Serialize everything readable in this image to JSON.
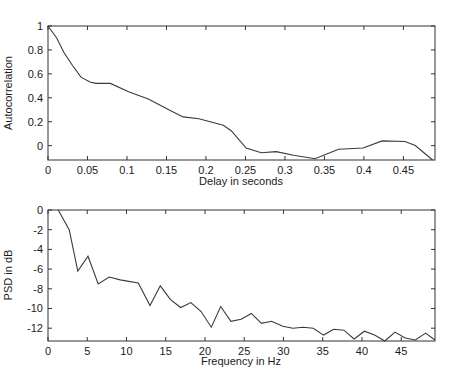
{
  "chart_data": [
    {
      "type": "line",
      "title": "",
      "xlabel": "Delay in seconds",
      "ylabel": "Autocorrelation",
      "xlim": [
        0,
        0.49
      ],
      "ylim": [
        -0.12,
        1
      ],
      "grid": false,
      "legend": null,
      "xticks": [
        0,
        0.05,
        0.1,
        0.15,
        0.2,
        0.25,
        0.3,
        0.35,
        0.4,
        0.45
      ],
      "xtick_labels": [
        "0",
        "0.05",
        "0.1",
        "0.15",
        "0.2",
        "0.25",
        "0.3",
        "0.35",
        "0.4",
        "0.45"
      ],
      "yticks": [
        0,
        0.2,
        0.4,
        0.6,
        0.8,
        1
      ],
      "ytick_labels": [
        "0",
        "0.2",
        "0.4",
        "0.6",
        "0.8",
        "1"
      ],
      "series": [
        {
          "name": "autocorrelation",
          "x": [
            0,
            0.011,
            0.02,
            0.031,
            0.042,
            0.054,
            0.061,
            0.079,
            0.102,
            0.127,
            0.153,
            0.171,
            0.191,
            0.222,
            0.232,
            0.251,
            0.27,
            0.289,
            0.311,
            0.338,
            0.368,
            0.399,
            0.423,
            0.452,
            0.465,
            0.487
          ],
          "values": [
            1.0,
            0.9,
            0.78,
            0.67,
            0.57,
            0.53,
            0.52,
            0.52,
            0.45,
            0.39,
            0.3,
            0.24,
            0.225,
            0.17,
            0.125,
            -0.02,
            -0.06,
            -0.05,
            -0.08,
            -0.11,
            -0.03,
            -0.02,
            0.04,
            0.035,
            0.0,
            -0.12
          ]
        }
      ]
    },
    {
      "type": "line",
      "title": "",
      "xlabel": "Frequency in Hz",
      "ylabel": "PSD in dB",
      "xlim": [
        0,
        49.3
      ],
      "ylim": [
        -13.3,
        0
      ],
      "grid": false,
      "legend": null,
      "xticks": [
        0,
        5,
        10,
        15,
        20,
        25,
        30,
        35,
        40,
        45
      ],
      "xtick_labels": [
        "0",
        "5",
        "10",
        "15",
        "20",
        "25",
        "30",
        "35",
        "40",
        "45"
      ],
      "yticks": [
        0,
        -2,
        -4,
        -6,
        -8,
        -10,
        -12
      ],
      "ytick_labels": [
        "0",
        "-2",
        "-4",
        "-6",
        "-8",
        "-10",
        "-12"
      ],
      "series": [
        {
          "name": "PSD",
          "x": [
            1.3,
            2.7,
            3.8,
            5.1,
            6.4,
            7.8,
            9.2,
            11.5,
            13.0,
            14.3,
            15.6,
            16.9,
            18.2,
            19.5,
            20.8,
            22.0,
            23.3,
            24.6,
            25.9,
            27.2,
            28.5,
            29.9,
            31.2,
            32.5,
            33.8,
            35.1,
            36.4,
            37.7,
            39.0,
            40.3,
            41.6,
            42.9,
            44.2,
            45.5,
            46.8,
            48.1,
            49.3
          ],
          "values": [
            0,
            -2.0,
            -6.2,
            -4.7,
            -7.5,
            -6.8,
            -7.1,
            -7.4,
            -9.7,
            -7.7,
            -9.1,
            -9.9,
            -9.4,
            -10.3,
            -11.9,
            -9.8,
            -11.3,
            -11.1,
            -10.5,
            -11.5,
            -11.3,
            -11.8,
            -12.0,
            -11.9,
            -12.0,
            -12.7,
            -12.1,
            -12.2,
            -13.1,
            -12.3,
            -12.7,
            -13.3,
            -12.4,
            -13.0,
            -13.2,
            -12.5,
            -13.2
          ]
        }
      ]
    }
  ],
  "plots": {
    "top": {
      "xlabel": "Delay in seconds",
      "ylabel": "Autocorrelation"
    },
    "bottom": {
      "xlabel": "Frequency in Hz",
      "ylabel": "PSD in dB"
    }
  },
  "colors": {
    "line": "#3a3a3a",
    "axes": "#333333",
    "text": "#1a1a1a",
    "background": "#ffffff"
  }
}
